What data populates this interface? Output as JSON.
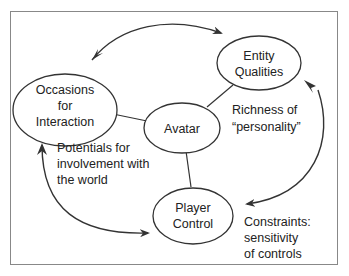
{
  "colors": {
    "stroke": "#333333",
    "frame": "#888888",
    "text": "#222222",
    "background": "#ffffff"
  },
  "nodes": {
    "occasions": {
      "lines": [
        "Occasions",
        "for",
        "Interaction"
      ]
    },
    "entity": {
      "lines": [
        "Entity",
        "Qualities"
      ]
    },
    "avatar": {
      "lines": [
        "Avatar"
      ]
    },
    "player": {
      "lines": [
        "Player",
        "Control"
      ]
    }
  },
  "annotations": {
    "richness": {
      "lines": [
        "Richness of",
        "“personality”"
      ]
    },
    "potentials": {
      "lines": [
        "Potentials for",
        "involvement with",
        "the world"
      ]
    },
    "constraints": {
      "lines": [
        "Constraints:",
        "sensitivity",
        "of controls"
      ]
    }
  }
}
